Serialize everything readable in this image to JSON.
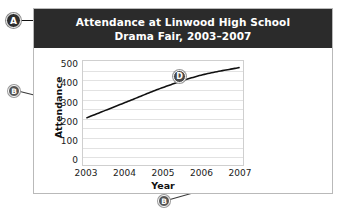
{
  "figure": {
    "title_line_1": "Attendance at Linwood High School",
    "title_line_2": "Drama Fair, 2003–2007"
  },
  "callouts": [
    {
      "id": "A",
      "label": "A",
      "target": "chart-title"
    },
    {
      "id": "B-left",
      "label": "B",
      "target": "y-axis-title"
    },
    {
      "id": "B-bottom",
      "label": "B",
      "target": "x-axis-title"
    },
    {
      "id": "D",
      "label": "D",
      "target": "data-line"
    }
  ],
  "chart_data": {
    "type": "line",
    "title": "Attendance at Linwood High School Drama Fair, 2003–2007",
    "xlabel": "Year",
    "ylabel": "Attendance",
    "x": [
      2003,
      2004,
      2005,
      2006,
      2007
    ],
    "categories": [
      "2003",
      "2004",
      "2005",
      "2006",
      "2007"
    ],
    "values": [
      250,
      330,
      410,
      475,
      515
    ],
    "series": [
      {
        "name": "Attendance",
        "values": [
          250,
          330,
          410,
          475,
          515
        ]
      }
    ],
    "ylim": [
      0,
      550
    ],
    "xlim": [
      2003,
      2007
    ],
    "ytick_labels": [
      "500",
      "400",
      "300",
      "200",
      "100",
      "0"
    ],
    "ytick_values": [
      500,
      400,
      300,
      200,
      100,
      0
    ],
    "xtick_labels": [
      "2003",
      "2004",
      "2005",
      "2006",
      "2007"
    ],
    "gridlines": true,
    "gridline_interval": 50,
    "legend": null,
    "line_color": "#111111",
    "grid_color": "#e2e2e2",
    "banner_color": "#2b2b2b"
  }
}
